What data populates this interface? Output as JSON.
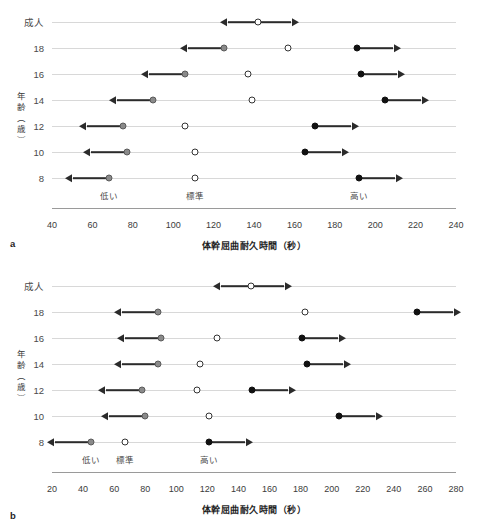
{
  "figure": {
    "panels": [
      {
        "letter": "a",
        "ylabel": "年齢（歳）",
        "xlabel": "体幹屈曲耐久時間（秒）",
        "xticks": [
          40,
          60,
          80,
          100,
          120,
          140,
          160,
          180,
          200,
          220,
          240
        ],
        "zones": [
          {
            "label": "低い",
            "at": 68
          },
          {
            "label": "標準",
            "at": 111
          },
          {
            "label": "高い",
            "at": 192
          }
        ],
        "rows": [
          {
            "label": "成人",
            "low": null,
            "standard": 142,
            "high": null,
            "single_arrows": true
          },
          {
            "label": "18",
            "low": 125,
            "standard": 157,
            "high": 191
          },
          {
            "label": "16",
            "low": 106,
            "standard": 137,
            "high": 193
          },
          {
            "label": "14",
            "low": 90,
            "standard": 139,
            "high": 205
          },
          {
            "label": "12",
            "low": 75,
            "standard": 106,
            "high": 170
          },
          {
            "label": "10",
            "low": 77,
            "standard": 111,
            "high": 165
          },
          {
            "label": "8",
            "low": 68,
            "standard": 111,
            "high": 192
          }
        ]
      },
      {
        "letter": "b",
        "ylabel": "年齢（歳）",
        "xlabel": "体幹屈曲耐久時間（秒）",
        "xticks": [
          20,
          40,
          60,
          80,
          100,
          120,
          140,
          160,
          180,
          200,
          220,
          240,
          260,
          280
        ],
        "zones": [
          {
            "label": "低い",
            "at": 45
          },
          {
            "label": "標準",
            "at": 67
          },
          {
            "label": "高い",
            "at": 121
          }
        ],
        "rows": [
          {
            "label": "成人",
            "low": null,
            "standard": 148,
            "high": null,
            "single_arrows": true
          },
          {
            "label": "18",
            "low": 88,
            "standard": 183,
            "high": 255
          },
          {
            "label": "16",
            "low": 90,
            "standard": 126,
            "high": 181
          },
          {
            "label": "14",
            "low": 88,
            "standard": 115,
            "high": 184
          },
          {
            "label": "12",
            "low": 78,
            "standard": 113,
            "high": 149
          },
          {
            "label": "10",
            "low": 80,
            "standard": 121,
            "high": 205
          },
          {
            "label": "8",
            "low": 45,
            "standard": 67,
            "high": 121
          }
        ]
      }
    ]
  },
  "chart_data": {
    "type": "scatter",
    "title": "",
    "xlabel": "体幹屈曲耐久時間（秒）",
    "ylabel": "年齢（歳）",
    "legend": [
      "低い",
      "標準",
      "高い"
    ],
    "legend_position": "inline-bottom",
    "grid": true,
    "panels": [
      {
        "panel": "a",
        "xlim": [
          40,
          240
        ],
        "xticks": [
          40,
          60,
          80,
          100,
          120,
          140,
          160,
          180,
          200,
          220,
          240
        ],
        "categories": [
          "成人",
          "18",
          "16",
          "14",
          "12",
          "10",
          "8"
        ],
        "series": [
          {
            "name": "低い",
            "marker": "gray-filled-circle",
            "arrow": "left",
            "values": [
              null,
              125,
              106,
              90,
              75,
              77,
              68
            ]
          },
          {
            "name": "標準",
            "marker": "open-circle",
            "arrow": "none",
            "values": [
              142,
              157,
              137,
              139,
              106,
              111,
              111
            ]
          },
          {
            "name": "高い",
            "marker": "black-filled-circle",
            "arrow": "right",
            "values": [
              null,
              191,
              193,
              205,
              170,
              165,
              192
            ]
          }
        ],
        "adult_row_note": "成人 row shows a single open circle at 142 with bidirectional arrows"
      },
      {
        "panel": "b",
        "xlim": [
          20,
          280
        ],
        "xticks": [
          20,
          40,
          60,
          80,
          100,
          120,
          140,
          160,
          180,
          200,
          220,
          240,
          260,
          280
        ],
        "categories": [
          "成人",
          "18",
          "16",
          "14",
          "12",
          "10",
          "8"
        ],
        "series": [
          {
            "name": "低い",
            "marker": "gray-filled-circle",
            "arrow": "left",
            "values": [
              null,
              88,
              90,
              88,
              78,
              80,
              45
            ]
          },
          {
            "name": "標準",
            "marker": "open-circle",
            "arrow": "none",
            "values": [
              148,
              183,
              126,
              115,
              113,
              121,
              67
            ]
          },
          {
            "name": "高い",
            "marker": "black-filled-circle",
            "arrow": "right",
            "values": [
              null,
              255,
              181,
              184,
              149,
              205,
              121
            ]
          }
        ],
        "adult_row_note": "成人 row shows a single open circle at 148 with bidirectional arrows"
      }
    ],
    "colors": {
      "low": "#8a8a8a",
      "standard": "#ffffff",
      "high": "#111111",
      "gridline": "#d8d8d8",
      "axis": "#9a9a9a"
    }
  }
}
